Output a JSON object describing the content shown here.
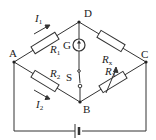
{
  "diagram": {
    "type": "circuit",
    "nodes": [
      {
        "id": "A",
        "label": "A"
      },
      {
        "id": "B",
        "label": "B"
      },
      {
        "id": "C",
        "label": "C"
      },
      {
        "id": "D",
        "label": "D"
      }
    ],
    "components": [
      {
        "id": "R1",
        "symbol": "R",
        "subscript": "1",
        "between": [
          "A",
          "D"
        ],
        "kind": "resistor"
      },
      {
        "id": "Rx",
        "symbol": "R",
        "subscript": "x",
        "between": [
          "D",
          "C"
        ],
        "kind": "resistor"
      },
      {
        "id": "R2",
        "symbol": "R",
        "subscript": "2",
        "between": [
          "A",
          "B"
        ],
        "kind": "resistor"
      },
      {
        "id": "R3",
        "symbol": "R",
        "subscript": "3",
        "between": [
          "B",
          "C"
        ],
        "kind": "variable-resistor"
      },
      {
        "id": "G",
        "symbol": "G",
        "between": [
          "D",
          "B"
        ],
        "kind": "galvanometer"
      },
      {
        "id": "S",
        "symbol": "S",
        "between": [
          "D",
          "B"
        ],
        "kind": "switch"
      },
      {
        "id": "E",
        "symbol": "",
        "between": [
          "A",
          "C"
        ],
        "kind": "battery"
      }
    ],
    "currents": [
      {
        "symbol": "I",
        "subscript": "1",
        "branch": "A-D"
      },
      {
        "symbol": "I",
        "subscript": "2",
        "branch": "A-B"
      }
    ],
    "colors": {
      "line": "#333333",
      "background": "#ffffff"
    }
  }
}
